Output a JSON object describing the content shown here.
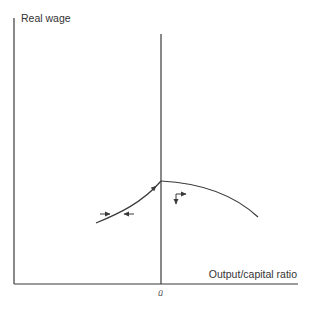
{
  "diagram": {
    "type": "phase-diagram",
    "y_axis_label": "Real wage",
    "x_axis_label": "Output/capital ratio",
    "vertical_line_label": "ū",
    "colors": {
      "line": "#3a3a3a",
      "text": "#333333",
      "background": "#ffffff"
    },
    "curves": [
      {
        "name": "left-rising-curve",
        "description": "convex rising curve approaching vertical line at ū"
      },
      {
        "name": "right-falling-curve",
        "description": "concave falling curve starting at ū"
      }
    ],
    "arrows": [
      {
        "name": "arrow-right",
        "direction": "right"
      },
      {
        "name": "arrow-left",
        "direction": "left"
      },
      {
        "name": "arrow-along-curve",
        "direction": "up-right"
      },
      {
        "name": "arrow-corner",
        "direction": "down-and-right"
      }
    ]
  }
}
